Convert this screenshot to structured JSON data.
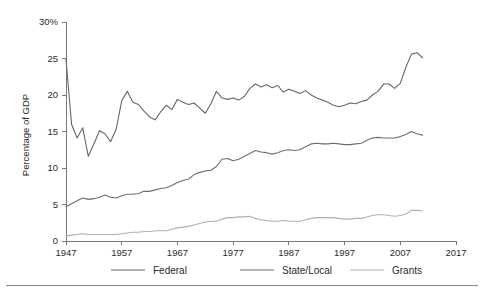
{
  "chart_data": {
    "type": "line",
    "title": "",
    "subtitle": "",
    "xlabel": "",
    "ylabel": "Percentage of GDP",
    "xlim": [
      1947,
      2017
    ],
    "ylim": [
      0,
      30
    ],
    "xticks": [
      1947,
      1957,
      1967,
      1977,
      1987,
      1997,
      2007,
      2017
    ],
    "xticklabels": [
      "1947",
      "1957",
      "1967",
      "1977",
      "1987",
      "1997",
      "2007",
      "2017"
    ],
    "yticks": [
      0,
      5,
      10,
      15,
      20,
      25,
      30
    ],
    "yticklabels": [
      "0",
      "5",
      "10",
      "15",
      "20",
      "25",
      "30%"
    ],
    "grid": false,
    "legend_position": "bottom",
    "x": [
      1947,
      1948,
      1949,
      1950,
      1951,
      1952,
      1953,
      1954,
      1955,
      1956,
      1957,
      1958,
      1959,
      1960,
      1961,
      1962,
      1963,
      1964,
      1965,
      1966,
      1967,
      1968,
      1969,
      1970,
      1971,
      1972,
      1973,
      1974,
      1975,
      1976,
      1977,
      1978,
      1979,
      1980,
      1981,
      1982,
      1983,
      1984,
      1985,
      1986,
      1987,
      1988,
      1989,
      1990,
      1991,
      1992,
      1993,
      1994,
      1995,
      1996,
      1997,
      1998,
      1999,
      2000,
      2001,
      2002,
      2003,
      2004,
      2005,
      2006,
      2007,
      2008,
      2009,
      2010,
      2011
    ],
    "series": [
      {
        "name": "Federal",
        "color": "#666666",
        "values": [
          24.9,
          16.0,
          14.1,
          15.5,
          11.6,
          13.3,
          15.1,
          14.7,
          13.6,
          15.3,
          19.2,
          20.5,
          19.0,
          18.7,
          17.8,
          17.0,
          16.6,
          17.7,
          18.6,
          18.0,
          19.4,
          19.0,
          18.7,
          18.9,
          18.2,
          17.5,
          18.8,
          20.5,
          19.6,
          19.4,
          19.6,
          19.3,
          19.8,
          20.9,
          21.5,
          21.1,
          21.4,
          21.0,
          21.3,
          20.4,
          20.8,
          20.5,
          20.2,
          20.6,
          20.0,
          19.6,
          19.3,
          19.0,
          18.6,
          18.4,
          18.6,
          18.9,
          18.8,
          19.1,
          19.3,
          20.0,
          20.5,
          21.5,
          21.5,
          20.9,
          21.6,
          23.8,
          25.6,
          25.8,
          25.1
        ]
      },
      {
        "name": "State/Local",
        "color": "#6e6e6e",
        "values": [
          4.7,
          5.1,
          5.5,
          5.9,
          5.7,
          5.8,
          6.0,
          6.3,
          6.0,
          5.9,
          6.2,
          6.4,
          6.4,
          6.5,
          6.8,
          6.8,
          7.0,
          7.2,
          7.3,
          7.6,
          8.0,
          8.3,
          8.5,
          9.1,
          9.4,
          9.6,
          9.7,
          10.2,
          11.2,
          11.3,
          11.0,
          11.2,
          11.6,
          12.0,
          12.4,
          12.2,
          12.1,
          11.9,
          12.1,
          12.4,
          12.5,
          12.4,
          12.5,
          12.9,
          13.3,
          13.4,
          13.3,
          13.3,
          13.4,
          13.3,
          13.2,
          13.2,
          13.3,
          13.4,
          13.8,
          14.1,
          14.2,
          14.1,
          14.1,
          14.1,
          14.3,
          14.6,
          15.0,
          14.7,
          14.5
        ]
      },
      {
        "name": "Grants",
        "color": "#b0b0b0",
        "values": [
          0.7,
          0.8,
          0.9,
          1.0,
          0.9,
          0.9,
          0.9,
          0.9,
          0.9,
          0.9,
          1.0,
          1.1,
          1.2,
          1.2,
          1.3,
          1.3,
          1.4,
          1.4,
          1.4,
          1.6,
          1.8,
          1.9,
          2.0,
          2.2,
          2.4,
          2.6,
          2.7,
          2.7,
          3.0,
          3.2,
          3.2,
          3.3,
          3.3,
          3.4,
          3.1,
          2.9,
          2.8,
          2.7,
          2.7,
          2.8,
          2.7,
          2.7,
          2.7,
          2.9,
          3.1,
          3.2,
          3.2,
          3.2,
          3.2,
          3.1,
          3.0,
          3.0,
          3.1,
          3.1,
          3.3,
          3.5,
          3.6,
          3.6,
          3.5,
          3.4,
          3.5,
          3.7,
          4.2,
          4.2,
          4.1
        ]
      }
    ],
    "legend": [
      {
        "label": "Federal",
        "color": "#666666"
      },
      {
        "label": "State/Local",
        "color": "#6e6e6e"
      },
      {
        "label": "Grants",
        "color": "#b0b0b0"
      }
    ]
  },
  "footer": {
    "rule_color": "#888888"
  }
}
